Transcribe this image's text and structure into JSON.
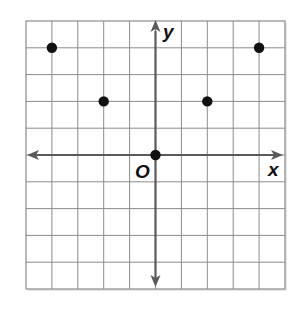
{
  "diagram": {
    "type": "coordinate-plane",
    "grid": {
      "columns": 10,
      "rows": 10,
      "x_range": [
        -5,
        5
      ],
      "y_range": [
        -5,
        5
      ],
      "gridline_color": "#8c8c8c",
      "background": "#ffffff"
    },
    "axes": {
      "x_label": "x",
      "y_label": "y",
      "origin_label": "O",
      "axis_color": "#5a5a5a"
    },
    "points": [
      {
        "x": -4,
        "y": 4
      },
      {
        "x": -2,
        "y": 2
      },
      {
        "x": 0,
        "y": 0
      },
      {
        "x": 2,
        "y": 2
      },
      {
        "x": 4,
        "y": 4
      }
    ],
    "point_color": "#111111"
  },
  "chart_data": {
    "type": "scatter",
    "title": "",
    "xlabel": "x",
    "ylabel": "y",
    "xlim": [
      -5,
      5
    ],
    "ylim": [
      -5,
      5
    ],
    "grid": true,
    "tick_labels": false,
    "series": [
      {
        "name": "points",
        "x": [
          -4,
          -2,
          0,
          2,
          4
        ],
        "y": [
          4,
          2,
          0,
          2,
          4
        ]
      }
    ],
    "annotations": [
      "O (origin)"
    ]
  }
}
